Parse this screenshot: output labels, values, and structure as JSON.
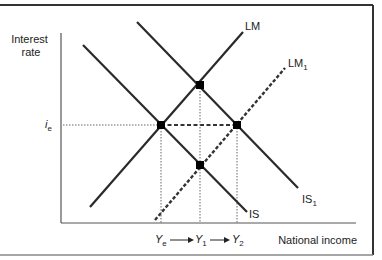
{
  "axes": {
    "y_label_line1": "Interest",
    "y_label_line2": "rate",
    "x_label": "National income"
  },
  "curves": {
    "IS": {
      "label": "IS",
      "sub": ""
    },
    "IS1": {
      "label": "IS",
      "sub": "1"
    },
    "LM": {
      "label": "LM",
      "sub": ""
    },
    "LM1": {
      "label": "LM",
      "sub": "1"
    }
  },
  "interest_marker": {
    "label": "i",
    "sub": "e"
  },
  "income_markers": [
    {
      "label": "Y",
      "sub": "e"
    },
    {
      "label": "Y",
      "sub": "1"
    },
    {
      "label": "Y",
      "sub": "2"
    }
  ],
  "equilibria": [
    {
      "name": "initial",
      "curves": "IS & LM",
      "income": "Ye",
      "interest": "ie"
    },
    {
      "name": "IS1-LM",
      "curves": "IS1 & LM",
      "income": "Y1",
      "interest": "above ie"
    },
    {
      "name": "IS1-LM1",
      "curves": "IS1 & LM1",
      "income": "Y2",
      "interest": "ie"
    },
    {
      "name": "IS-LM1",
      "curves": "IS & LM1",
      "income": "Y1",
      "interest": "below ie"
    }
  ],
  "colors": {
    "line": "#2a2a2a",
    "axis": "#555555",
    "dotted": "#666666",
    "border": "#333333"
  }
}
